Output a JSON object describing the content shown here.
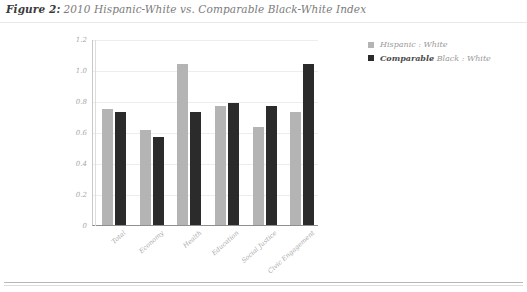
{
  "figure": {
    "label": "Figure 2:",
    "title": "2010 Hispanic-White vs. Comparable Black-White Index"
  },
  "legend": [
    {
      "name": "legend-hispanic-white",
      "emphasis": "",
      "label": "Hispanic : White",
      "color": "#b4b4b4"
    },
    {
      "name": "legend-comparable-black-white",
      "emphasis": "Comparable",
      "label": "Black : White",
      "color": "#2b2b2b"
    }
  ],
  "chart_data": {
    "type": "bar",
    "title": "2010 Hispanic-White vs. Comparable Black-White Index",
    "xlabel": "",
    "ylabel": "",
    "ylim": [
      0,
      1.2
    ],
    "yticks": [
      "0",
      "0.2",
      "0.4",
      "0.6",
      "0.8",
      "1.0",
      "1.2"
    ],
    "ytick_values": [
      0,
      0.2,
      0.4,
      0.6,
      0.8,
      1.0,
      1.2
    ],
    "grid": true,
    "legend_position": "right",
    "categories": [
      "Total",
      "Economy",
      "Health",
      "Education",
      "Social Justice",
      "Civic Engagement"
    ],
    "series": [
      {
        "name": "Hispanic : White",
        "color": "#b4b4b4",
        "values": [
          0.75,
          0.61,
          1.04,
          0.77,
          0.63,
          0.73
        ]
      },
      {
        "name": "Comparable Black : White",
        "color": "#2b2b2b",
        "values": [
          0.73,
          0.57,
          0.73,
          0.79,
          0.77,
          1.04
        ]
      }
    ]
  }
}
